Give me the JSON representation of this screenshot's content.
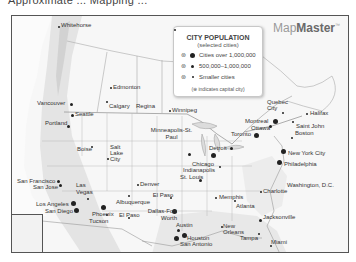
{
  "header": {
    "cut_off_title": "Approximate ... Mapping ... "
  },
  "brand": {
    "light": "Map",
    "bold": "Master",
    "tm": "™"
  },
  "legend": {
    "title": "CITY POPULATION",
    "subtitle": "(selected cities)",
    "rows": [
      {
        "label": "Cities over 1,000,000",
        "size": "big"
      },
      {
        "label": "500,000–1,000,000",
        "size": "mid"
      },
      {
        "label": "Smaller cities",
        "size": "sm"
      }
    ],
    "capital_symbol": "⊛",
    "note": "(⊛ indicates capital city)"
  },
  "cities": [
    {
      "name": "Whitehorse",
      "x": 163,
      "y": 9
    },
    {
      "name": "Edmonton",
      "x": 112,
      "y": 65
    },
    {
      "name": "Calgary",
      "x": 98,
      "y": 82
    },
    {
      "name": "Regina",
      "x": 138,
      "y": 83
    },
    {
      "name": "Winnipeg",
      "x": 174,
      "y": 88
    },
    {
      "name": "Vancouver",
      "x": 18,
      "y": 84
    },
    {
      "name": "Seattle",
      "x": 62,
      "y": 97
    },
    {
      "name": "Portland",
      "x": 33,
      "y": 107
    },
    {
      "name": "Boise",
      "x": 78,
      "y": 132
    },
    {
      "name": "Salt Lake City",
      "x": 97,
      "y": 129
    },
    {
      "name": "Denver",
      "x": 137,
      "y": 156
    },
    {
      "name": "Minneapolis-St. Paul",
      "x": 157,
      "y": 116
    },
    {
      "name": "Chicago",
      "x": 192,
      "y": 150
    },
    {
      "name": "Indianapolis",
      "x": 188,
      "y": 157
    },
    {
      "name": "St. Louis",
      "x": 180,
      "y": 167
    },
    {
      "name": "Detroit",
      "x": 208,
      "y": 142
    },
    {
      "name": "Toronto",
      "x": 222,
      "y": 128
    },
    {
      "name": "Ottawa",
      "x": 229,
      "y": 122
    },
    {
      "name": "Montreal",
      "x": 243,
      "y": 111
    },
    {
      "name": "Quebec City",
      "x": 264,
      "y": 97
    },
    {
      "name": "Halifax",
      "x": 306,
      "y": 109
    },
    {
      "name": "Saint John",
      "x": 292,
      "y": 123
    },
    {
      "name": "Boston",
      "x": 284,
      "y": 131
    },
    {
      "name": "New York City",
      "x": 275,
      "y": 150
    },
    {
      "name": "Philadelphia",
      "x": 271,
      "y": 162
    },
    {
      "name": "Washington, D.C.",
      "x": 274,
      "y": 184
    },
    {
      "name": "Charlotte",
      "x": 253,
      "y": 189
    },
    {
      "name": "Memphis",
      "x": 207,
      "y": 193
    },
    {
      "name": "Atlanta",
      "x": 235,
      "y": 200
    },
    {
      "name": "Jacksonville",
      "x": 254,
      "y": 214
    },
    {
      "name": "New Orleans",
      "x": 210,
      "y": 220
    },
    {
      "name": "Tampa",
      "x": 235,
      "y": 235
    },
    {
      "name": "Miami",
      "x": 260,
      "y": 238
    },
    {
      "name": "San Francisco",
      "x": 7,
      "y": 171
    },
    {
      "name": "San Jose",
      "x": 19,
      "y": 178
    },
    {
      "name": "Las Vegas",
      "x": 60,
      "y": 177
    },
    {
      "name": "Los Angeles",
      "x": 24,
      "y": 199
    },
    {
      "name": "San Diego",
      "x": 32,
      "y": 207
    },
    {
      "name": "Phoenix",
      "x": 79,
      "y": 205
    },
    {
      "name": "Tucson",
      "x": 80,
      "y": 212
    },
    {
      "name": "Albuquerque",
      "x": 104,
      "y": 195
    },
    {
      "name": "El Paso",
      "x": 107,
      "y": 212
    },
    {
      "name": "Oklahoma City",
      "x": 136,
      "y": 190
    },
    {
      "name": "Dallas-Fort Worth",
      "x": 130,
      "y": 209
    },
    {
      "name": "Austin",
      "x": 162,
      "y": 222
    },
    {
      "name": "Houston",
      "x": 172,
      "y": 233
    },
    {
      "name": "San Antonio",
      "x": 155,
      "y": 239
    }
  ],
  "colors": {
    "frame": "#555555",
    "land": "#f6f6f6",
    "dot": "#222222",
    "label": "#333333"
  }
}
